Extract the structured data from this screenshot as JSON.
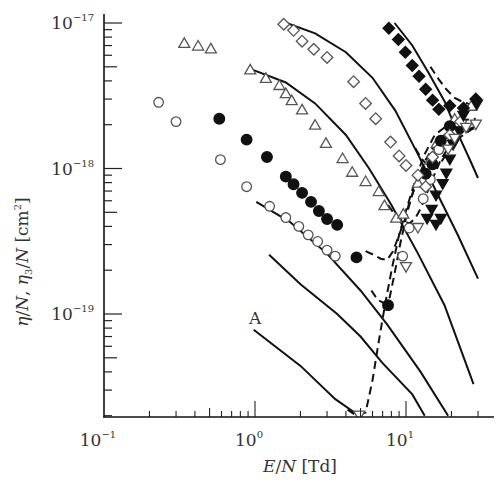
{
  "chart_data": {
    "type": "scatter",
    "title": "",
    "xlabel": "E/N [Td]",
    "ylabel": "η/N, η3/N [cm²]",
    "xscale": "log",
    "yscale": "log",
    "xlim": [
      0.1,
      39
    ],
    "ylim": [
      1.95e-20,
      1.05e-17
    ],
    "grid": false,
    "legend": "none",
    "x_ticks": [
      {
        "value": 0.1,
        "label_base": "10",
        "label_exp": "−1"
      },
      {
        "value": 1,
        "label_base": "10",
        "label_exp": "0"
      },
      {
        "value": 10,
        "label_base": "10",
        "label_exp": "1"
      }
    ],
    "y_ticks": [
      {
        "value": 1e-17,
        "label_base": "10",
        "label_exp": "−17"
      },
      {
        "value": 1e-18,
        "label_base": "10",
        "label_exp": "−18"
      },
      {
        "value": 1e-19,
        "label_base": "10",
        "label_exp": "−19"
      }
    ],
    "annotations": [
      {
        "text": "A",
        "x": 0.93,
        "y": 1.1e-19
      }
    ],
    "series": [
      {
        "name": "open-triangle",
        "marker": "triangle-up",
        "fill": "open",
        "points": [
          [
            0.34,
            7.3e-18
          ],
          [
            0.42,
            7e-18
          ],
          [
            0.51,
            6.7e-18
          ],
          [
            0.93,
            4.8e-18
          ],
          [
            1.18,
            4.2e-18
          ],
          [
            1.45,
            3.75e-18
          ],
          [
            1.6,
            3.3e-18
          ],
          [
            1.75,
            2.95e-18
          ],
          [
            2.05,
            2.55e-18
          ],
          [
            2.5,
            2e-18
          ],
          [
            2.95,
            1.5e-18
          ],
          [
            3.8,
            1.18e-18
          ],
          [
            4.4,
            9.5e-19
          ],
          [
            5.4,
            8.2e-19
          ],
          [
            6.6,
            7e-19
          ],
          [
            7.2,
            5.6e-19
          ],
          [
            8.6,
            4.6e-19
          ],
          [
            9.6,
            4.9e-19
          ],
          [
            12.0,
            8e-19
          ],
          [
            14.5,
            1.15e-18
          ],
          [
            16.0,
            1.5e-18
          ],
          [
            21.0,
            2.2e-18
          ],
          [
            27.0,
            2.7e-18
          ]
        ]
      },
      {
        "name": "open-circle",
        "marker": "circle",
        "fill": "open",
        "points": [
          [
            0.23,
            2.85e-18
          ],
          [
            0.3,
            2.1e-18
          ],
          [
            0.59,
            1.15e-18
          ],
          [
            0.88,
            7.5e-19
          ],
          [
            1.25,
            5.5e-19
          ],
          [
            1.6,
            4.6e-19
          ],
          [
            1.95,
            4e-19
          ],
          [
            2.25,
            3.5e-19
          ],
          [
            2.6,
            3.15e-19
          ],
          [
            3.0,
            2.75e-19
          ],
          [
            3.4,
            2.5e-19
          ],
          [
            9.5,
            2.5e-19
          ],
          [
            10.5,
            3.9e-19
          ],
          [
            13.0,
            6.2e-19
          ],
          [
            14.5,
            8.4e-19
          ],
          [
            16.5,
            1.35e-18
          ],
          [
            21.0,
            1.8e-18
          ]
        ]
      },
      {
        "name": "filled-circle",
        "marker": "circle",
        "fill": "filled",
        "points": [
          [
            0.58,
            2.2e-18
          ],
          [
            0.88,
            1.58e-18
          ],
          [
            1.2,
            1.2e-18
          ],
          [
            1.6,
            8.8e-19
          ],
          [
            1.8,
            7.8e-19
          ],
          [
            2.05,
            6.8e-19
          ],
          [
            2.35,
            5.9e-19
          ],
          [
            2.65,
            5.1e-19
          ],
          [
            3.0,
            4.5e-19
          ],
          [
            3.5,
            4.1e-19
          ],
          [
            4.7,
            2.45e-19
          ],
          [
            7.6,
            1.15e-19
          ],
          [
            13.5,
            9.2e-19
          ],
          [
            15.0,
            1.07e-18
          ],
          [
            17.0,
            1.55e-18
          ],
          [
            19.5,
            1.95e-18
          ]
        ]
      },
      {
        "name": "open-diamond",
        "marker": "diamond",
        "fill": "open",
        "points": [
          [
            1.55,
            9.8e-18
          ],
          [
            1.8,
            8.9e-18
          ],
          [
            2.05,
            7.5e-18
          ],
          [
            2.45,
            6.6e-18
          ],
          [
            3.0,
            5.8e-18
          ],
          [
            4.5,
            3.95e-18
          ],
          [
            5.4,
            2.8e-18
          ],
          [
            6.3,
            2.2e-18
          ],
          [
            7.9,
            1.52e-18
          ],
          [
            9.0,
            1.22e-18
          ],
          [
            10.0,
            1.05e-18
          ],
          [
            12.0,
            9e-19
          ],
          [
            13.5,
            7.5e-19
          ],
          [
            15.0,
            1.2e-18
          ],
          [
            19.5,
            1.7e-18
          ],
          [
            23.0,
            2.1e-18
          ]
        ]
      },
      {
        "name": "filled-diamond",
        "marker": "diamond",
        "fill": "filled",
        "points": [
          [
            7.7,
            9.2e-18
          ],
          [
            8.9,
            7.7e-18
          ],
          [
            9.9,
            6.3e-18
          ],
          [
            11.0,
            5.1e-18
          ],
          [
            12.2,
            4.3e-18
          ],
          [
            13.5,
            3.5e-18
          ],
          [
            15.0,
            2.95e-18
          ],
          [
            16.5,
            2.55e-18
          ],
          [
            19.5,
            2.7e-18
          ],
          [
            24.0,
            2.6e-18
          ],
          [
            29.0,
            3e-18
          ]
        ]
      },
      {
        "name": "filled-triangle-down",
        "marker": "triangle-down",
        "fill": "filled",
        "points": [
          [
            17.5,
            7.8e-19
          ],
          [
            18.5,
            9.2e-19
          ],
          [
            19.5,
            1.15e-18
          ],
          [
            20.5,
            1.45e-18
          ],
          [
            22.5,
            1.8e-18
          ],
          [
            24.0,
            2.3e-18
          ],
          [
            29.5,
            2.75e-18
          ],
          [
            15.8,
            6.5e-19
          ],
          [
            14.8,
            5.2e-19
          ],
          [
            13.8,
            4.5e-19
          ],
          [
            15.8,
            4.1e-19
          ],
          [
            17.0,
            4.5e-19
          ]
        ]
      },
      {
        "name": "open-triangle-down",
        "marker": "triangle-down",
        "fill": "open",
        "points": [
          [
            19.0,
            1.35e-18
          ],
          [
            21.0,
            1.6e-18
          ],
          [
            25.0,
            1.9e-18
          ],
          [
            29.0,
            2e-18
          ],
          [
            12.0,
            3.9e-19
          ],
          [
            10.0,
            2.1e-19
          ],
          [
            4.9,
            2e-20
          ]
        ]
      }
    ],
    "solid_lines": [
      {
        "name": "curve-A",
        "points": [
          [
            0.98,
            7.8e-20
          ],
          [
            2.0,
            4.4e-20
          ],
          [
            3.4,
            2.6e-20
          ],
          [
            4.9,
            2e-20
          ]
        ]
      },
      {
        "name": "curve-1",
        "points": [
          [
            1.24,
            2.55e-19
          ],
          [
            2.0,
            1.6e-19
          ],
          [
            3.5,
            1e-19
          ],
          [
            5.0,
            7e-20
          ],
          [
            7.0,
            4.6e-20
          ],
          [
            11.0,
            2.8e-20
          ],
          [
            13.3,
            2e-20
          ]
        ]
      },
      {
        "name": "curve-2",
        "points": [
          [
            1.02,
            5.9e-19
          ],
          [
            1.7,
            4.3e-19
          ],
          [
            3.0,
            2.6e-19
          ],
          [
            5.0,
            1.45e-19
          ],
          [
            7.5,
            8.5e-20
          ],
          [
            12.5,
            4e-20
          ],
          [
            19.0,
            2e-20
          ]
        ]
      },
      {
        "name": "curve-3",
        "points": [
          [
            0.95,
            4.8e-18
          ],
          [
            1.6,
            3.9e-18
          ],
          [
            2.5,
            2.8e-18
          ],
          [
            4.0,
            1.7e-18
          ],
          [
            5.7,
            1e-18
          ],
          [
            8.0,
            5.6e-19
          ],
          [
            12.0,
            2.6e-19
          ],
          [
            18.0,
            1.15e-19
          ],
          [
            28.0,
            3.3e-20
          ]
        ]
      },
      {
        "name": "curve-4",
        "points": [
          [
            1.62,
            1e-17
          ],
          [
            2.5,
            8.5e-18
          ],
          [
            4.0,
            6.3e-18
          ],
          [
            6.0,
            4.2e-18
          ],
          [
            8.5,
            2.5e-18
          ],
          [
            12.0,
            1.25e-18
          ],
          [
            17.0,
            6e-19
          ],
          [
            22.0,
            3.5e-19
          ],
          [
            30.0,
            1.75e-19
          ]
        ]
      },
      {
        "name": "curve-5",
        "points": [
          [
            8.4,
            1e-17
          ],
          [
            11.0,
            7e-18
          ],
          [
            14.0,
            4.6e-18
          ],
          [
            18.0,
            2.9e-18
          ],
          [
            22.0,
            1.75e-18
          ],
          [
            27.0,
            1.1e-18
          ],
          [
            30.0,
            8.6e-19
          ]
        ]
      }
    ],
    "dashed_lines": [
      {
        "name": "dashed-1",
        "points": [
          [
            4.1,
            2.2e-20
          ],
          [
            4.7,
            2e-20
          ],
          [
            5.4,
            2.1e-20
          ],
          [
            6.0,
            3.5e-20
          ],
          [
            6.6,
            6.5e-20
          ],
          [
            7.3,
            1.2e-19
          ],
          [
            8.1,
            2.1e-19
          ],
          [
            9.0,
            3.5e-19
          ],
          [
            10.2,
            5.5e-19
          ],
          [
            11.4,
            8e-19
          ],
          [
            13.0,
            1.2e-18
          ],
          [
            15.5,
            1.7e-18
          ],
          [
            19.0,
            2e-18
          ],
          [
            24.0,
            2.15e-18
          ],
          [
            29.0,
            2.2e-18
          ]
        ]
      },
      {
        "name": "dashed-2",
        "points": [
          [
            5.9,
            1.45e-19
          ],
          [
            6.5,
            1.25e-19
          ],
          [
            7.2,
            1.18e-19
          ],
          [
            7.8,
            1.3e-19
          ],
          [
            8.4,
            1.9e-19
          ],
          [
            9.2,
            3.1e-19
          ],
          [
            10.2,
            5e-19
          ],
          [
            11.5,
            7.8e-19
          ],
          [
            13.5,
            1.15e-18
          ],
          [
            16.0,
            1.55e-18
          ],
          [
            20.0,
            1.85e-18
          ],
          [
            26.0,
            2e-18
          ]
        ]
      },
      {
        "name": "dashed-3",
        "points": [
          [
            5.4,
            2.7e-19
          ],
          [
            6.1,
            2.55e-19
          ],
          [
            6.8,
            2.4e-19
          ],
          [
            7.5,
            2.35e-19
          ],
          [
            8.2,
            2.7e-19
          ],
          [
            9.0,
            3.5e-19
          ],
          [
            9.8,
            4.4e-19
          ],
          [
            10.5,
            5.8e-19
          ],
          [
            11.5,
            7.5e-19
          ],
          [
            13.0,
            1e-18
          ],
          [
            16.0,
            1.45e-18
          ],
          [
            21.0,
            1.8e-18
          ],
          [
            27.0,
            2e-18
          ]
        ]
      },
      {
        "name": "dashed-4",
        "points": [
          [
            7.6,
            5.6e-19
          ],
          [
            8.6,
            4.7e-19
          ],
          [
            9.6,
            4.3e-19
          ],
          [
            10.6,
            4.2e-19
          ],
          [
            11.6,
            4.6e-19
          ],
          [
            12.6,
            5.4e-19
          ],
          [
            13.6,
            6.6e-19
          ],
          [
            15.0,
            8.5e-19
          ],
          [
            17.0,
            1.15e-18
          ],
          [
            20.0,
            1.5e-18
          ],
          [
            24.0,
            1.8e-18
          ],
          [
            29.0,
            1.95e-18
          ]
        ]
      },
      {
        "name": "dashed-5",
        "points": [
          [
            11.5,
            1.38e-18
          ],
          [
            12.8,
            1.15e-18
          ],
          [
            14.0,
            1.05e-18
          ],
          [
            15.3,
            1e-18
          ],
          [
            16.5,
            1.05e-18
          ],
          [
            18.0,
            1.2e-18
          ],
          [
            20.0,
            1.4e-18
          ],
          [
            23.0,
            1.65e-18
          ],
          [
            27.0,
            1.85e-18
          ],
          [
            30.0,
            1.95e-18
          ]
        ]
      },
      {
        "name": "dashed-6",
        "points": [
          [
            14.5,
            5e-18
          ],
          [
            16.5,
            4.1e-18
          ],
          [
            18.5,
            3.5e-18
          ],
          [
            21.0,
            3.05e-18
          ],
          [
            24.0,
            2.85e-18
          ],
          [
            27.0,
            2.75e-18
          ],
          [
            30.0,
            2.75e-18
          ]
        ]
      }
    ]
  }
}
